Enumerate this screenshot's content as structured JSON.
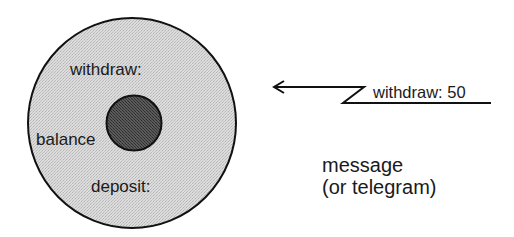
{
  "diagram": {
    "object": {
      "labels": {
        "method_withdraw": "withdraw:",
        "state_balance": "balance",
        "method_deposit": "deposit:"
      }
    },
    "message": {
      "text": "withdraw: 50",
      "direction": "toward-object"
    },
    "caption": {
      "line1": "message",
      "line2": "(or telegram)"
    },
    "colors": {
      "stroke": "#111111",
      "object_fill": "#d9d9d9",
      "state_fill": "#4a4a4a",
      "text": "#1a1a1a"
    }
  }
}
